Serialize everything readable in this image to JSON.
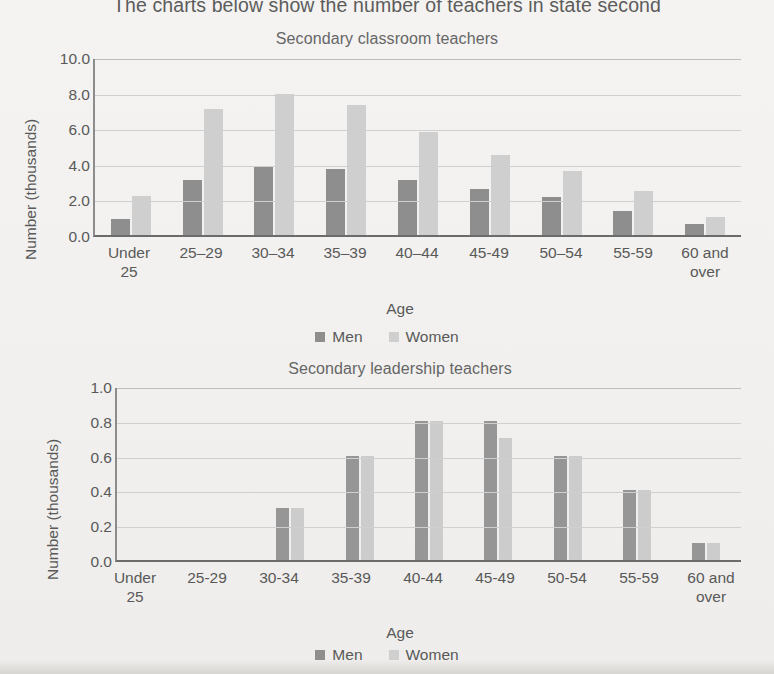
{
  "header": {
    "intro_text": "The charts below show the number of teachers in state second"
  },
  "legend": {
    "men_label": "Men",
    "women_label": "Women",
    "men_color": "#8e8e8e",
    "women_color": "#cfcfcf"
  },
  "axis": {
    "x_title": "Age",
    "y_title": "Number (thousands)"
  },
  "chart_data": [
    {
      "id": "secondary-classroom-teachers",
      "type": "bar",
      "title": "Secondary classroom teachers",
      "xlabel": "Age",
      "ylabel": "Number (thousands)",
      "ylim": [
        0,
        10
      ],
      "yticks": [
        "0.0",
        "2.0",
        "4.0",
        "6.0",
        "8.0",
        "10.0"
      ],
      "grid": true,
      "legend_position": "bottom",
      "categories": [
        "Under\n25",
        "25–29",
        "30–34",
        "35–39",
        "40–44",
        "45-49",
        "50–54",
        "55-59",
        "60 and\nover"
      ],
      "series": [
        {
          "name": "Men",
          "color": "#8e8e8e",
          "values": [
            0.9,
            3.1,
            3.85,
            3.7,
            3.1,
            2.6,
            2.15,
            1.35,
            0.6
          ]
        },
        {
          "name": "Women",
          "color": "#cfcfcf",
          "values": [
            2.2,
            7.1,
            7.9,
            7.3,
            5.8,
            4.5,
            3.6,
            2.5,
            1.0
          ]
        }
      ]
    },
    {
      "id": "secondary-leadership-teachers",
      "type": "bar",
      "title": "Secondary leadership teachers",
      "xlabel": "Age",
      "ylabel": "Number (thousands)",
      "ylim": [
        0,
        1.0
      ],
      "yticks": [
        "0.0",
        "0.2",
        "0.4",
        "0.6",
        "0.8",
        "1.0"
      ],
      "grid": true,
      "legend_position": "bottom",
      "categories": [
        "Under\n25",
        "25-29",
        "30-34",
        "35-39",
        "40-44",
        "45-49",
        "50-54",
        "55-59",
        "60 and\nover"
      ],
      "series": [
        {
          "name": "Men",
          "color": "#969696",
          "values": [
            0,
            0,
            0.3,
            0.6,
            0.8,
            0.8,
            0.6,
            0.4,
            0.1
          ]
        },
        {
          "name": "Women",
          "color": "#cccccc",
          "values": [
            0,
            0,
            0.3,
            0.6,
            0.8,
            0.7,
            0.6,
            0.4,
            0.1
          ]
        }
      ]
    }
  ]
}
